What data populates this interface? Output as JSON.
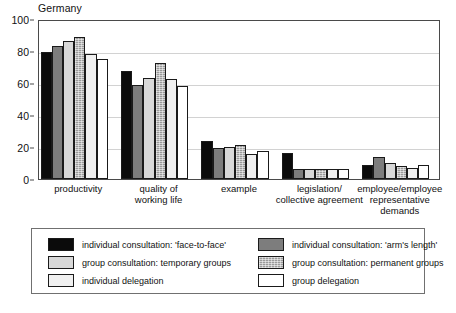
{
  "chart_data": {
    "type": "bar",
    "title": "Germany",
    "xlabel": "",
    "ylabel": "",
    "ylim": [
      0,
      100
    ],
    "yticks": [
      0,
      20,
      40,
      60,
      80,
      100
    ],
    "grid": true,
    "legend_position": "bottom",
    "categories": [
      "productivity",
      "quality of working life",
      "example",
      "legislation/ collective agreement",
      "employee/employee representative demands"
    ],
    "category_lines": [
      [
        "productivity"
      ],
      [
        "quality of",
        "working life"
      ],
      [
        "example"
      ],
      [
        "legislation/",
        "collective agreement"
      ],
      [
        "employee/employee",
        "representative",
        "demands"
      ]
    ],
    "series": [
      {
        "name": "individual consultation: 'face-to-face'",
        "fill": "black",
        "color": "#0b0b0b",
        "values": [
          79.5,
          67.5,
          23.5,
          16.5,
          9
        ]
      },
      {
        "name": "individual consultation: 'arm's length'",
        "fill": "darkgray",
        "color": "#7d7d7d",
        "values": [
          83,
          59,
          19.5,
          6,
          14
        ]
      },
      {
        "name": "group consultation: temporary groups",
        "fill": "lightgray",
        "color": "#d8d8d8",
        "values": [
          86.5,
          63,
          20,
          6,
          10
        ]
      },
      {
        "name": "group consultation: permanent groups",
        "fill": "hatch",
        "color": "#9a9a9a",
        "values": [
          88.5,
          72.5,
          21.5,
          6,
          8
        ]
      },
      {
        "name": "individual delegation",
        "fill": "palegray",
        "color": "#f0f0f0",
        "values": [
          78,
          62.5,
          15.5,
          6,
          7
        ]
      },
      {
        "name": "group delegation",
        "fill": "white",
        "color": "#ffffff",
        "values": [
          75,
          58,
          17.5,
          6,
          9
        ]
      }
    ]
  },
  "legend": {
    "entries": [
      {
        "label": "individual consultation: 'face-to-face'",
        "fill": "black"
      },
      {
        "label": "group consultation: temporary groups",
        "fill": "lightgray"
      },
      {
        "label": "individual delegation",
        "fill": "palegray"
      },
      {
        "label": "individual consultation: 'arm's length'",
        "fill": "darkgray"
      },
      {
        "label": "group consultation: permanent groups",
        "fill": "hatch"
      },
      {
        "label": "group delegation",
        "fill": "white"
      }
    ]
  }
}
